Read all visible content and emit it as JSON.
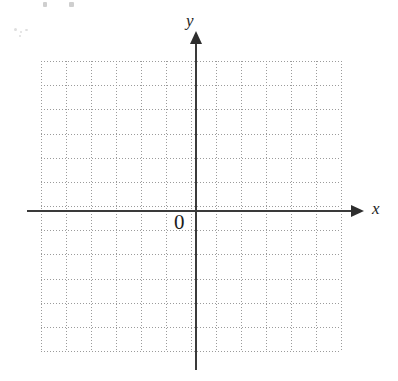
{
  "figure": {
    "kind": "cartesian-coordinate-grid",
    "background_color": "#ffffff",
    "axis_color": "#3a3a3a",
    "grid_color": "#9b9b9b",
    "text_color": "#1d1d1d",
    "origin_label": "0",
    "x_axis_label": "x",
    "y_axis_label": "y"
  },
  "chart_data": {
    "type": "scatter",
    "title": "",
    "subtitle": "",
    "xlabel": "x",
    "ylabel": "y",
    "origin_label": "0",
    "grid": true,
    "grid_style": "dotted",
    "legend": "none",
    "series": [],
    "x": [],
    "values": [],
    "xlim": [
      -6,
      6
    ],
    "ylim": [
      -6,
      6
    ],
    "x_tick_labels": [],
    "y_tick_labels": [],
    "annotations": [],
    "grid_columns": 12,
    "grid_rows": 12
  },
  "grid_geometry": {
    "left": 41,
    "top": 61,
    "width": 300,
    "height": 290,
    "cell_width": 25,
    "cell_height": 24.1666,
    "vertical_lines": [
      0,
      25,
      50,
      75,
      100,
      125,
      150,
      175,
      200,
      225,
      250,
      275,
      300
    ],
    "horizontal_lines": [
      0,
      24.1666,
      48.3333,
      72.5,
      96.6666,
      120.8333,
      145,
      169.1666,
      193.3333,
      217.5,
      241.6666,
      265.8333,
      290
    ]
  }
}
